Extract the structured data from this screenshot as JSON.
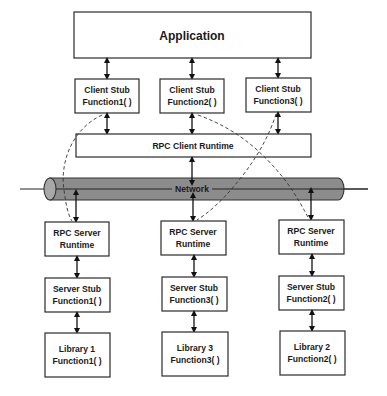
{
  "diagram": {
    "application": {
      "label": "Application"
    },
    "client_stubs": [
      {
        "line1": "Client Stub",
        "line2": "Function1( )"
      },
      {
        "line1": "Client Stub",
        "line2": "Function2( )"
      },
      {
        "line1": "Client Stub",
        "line2": "Function3( )"
      }
    ],
    "rpc_client_runtime": {
      "label": "RPC Client Runtime"
    },
    "network": {
      "label": "Network",
      "tube_color": "#8c8c8c"
    },
    "server_runtimes": [
      {
        "line1": "RPC Server",
        "line2": "Runtime"
      },
      {
        "line1": "RPC Server",
        "line2": "Runtime"
      },
      {
        "line1": "RPC Server",
        "line2": "Runtime"
      }
    ],
    "server_stubs": [
      {
        "line1": "Server Stub",
        "line2": "Function1( )"
      },
      {
        "line1": "Server Stub",
        "line2": "Function3( )"
      },
      {
        "line1": "Server Stub",
        "line2": "Function2( )"
      }
    ],
    "libraries": [
      {
        "line1": "Library 1",
        "line2": "Function1( )"
      },
      {
        "line1": "Library 3",
        "line2": "Function3( )"
      },
      {
        "line1": "Library 2",
        "line2": "Function2( )"
      }
    ],
    "connections": [
      {
        "from": "Client Stub Function1( )",
        "to": "RPC Server Runtime (column 1)",
        "style": "dashed"
      },
      {
        "from": "Client Stub Function2( )",
        "to": "RPC Server Runtime (column 3)",
        "style": "dashed"
      },
      {
        "from": "Client Stub Function3( )",
        "to": "RPC Server Runtime (column 2)",
        "style": "dashed"
      }
    ]
  }
}
